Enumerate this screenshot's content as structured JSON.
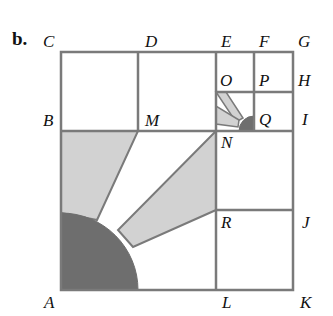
{
  "panel_label": "b.",
  "points": {
    "A": "A",
    "B": "B",
    "C": "C",
    "D": "D",
    "E": "E",
    "F": "F",
    "G": "G",
    "H": "H",
    "I": "I",
    "J": "J",
    "K": "K",
    "L": "L",
    "M": "M",
    "N": "N",
    "O": "O",
    "P": "P",
    "Q": "Q",
    "R": "R"
  },
  "colors": {
    "line": "#7a7a7a",
    "light_shade": "#d2d2d2",
    "dark_shade": "#6e6e6e",
    "background": "#ffffff"
  }
}
